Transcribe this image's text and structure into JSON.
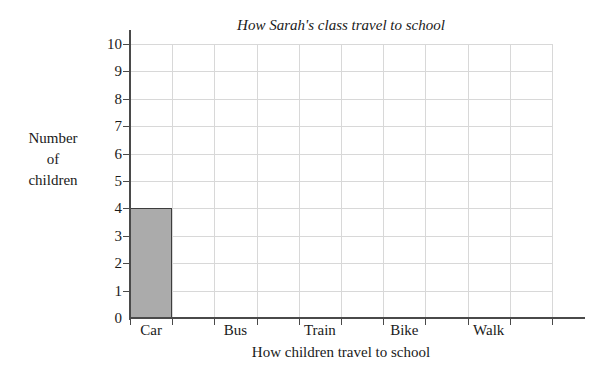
{
  "chart_data": {
    "type": "bar",
    "title": "How Sarah's class travel to school",
    "xlabel": "How children travel to school",
    "ylabel": "Number of children",
    "ylabel_lines": [
      "Number",
      "of",
      "children"
    ],
    "categories": [
      "Car",
      "Bus",
      "Train",
      "Bike",
      "Walk"
    ],
    "values": [
      4,
      0,
      0,
      0,
      0
    ],
    "ylim": [
      0,
      10
    ],
    "ytick_labels": [
      "0",
      "1",
      "2",
      "3",
      "4",
      "5",
      "6",
      "7",
      "8",
      "9",
      "10"
    ],
    "ytick_step": 1,
    "grid": true,
    "grid_color": "#d8d8d8",
    "legend": "none",
    "bar_fill_color": "#ababab",
    "bar_edge_color": "#3d3d3d",
    "axis_color": "#4a4a4a",
    "background_color": "#ffffff",
    "columns": 10
  }
}
